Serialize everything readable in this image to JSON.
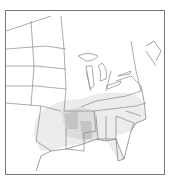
{
  "map": {
    "type": "species-range-map",
    "region": "Eastern United States",
    "colors": {
      "background": "#ffffff",
      "border": "#777777",
      "state_lines": "#888888",
      "range_light": "#e6e6e6",
      "range_medium": "#d2d2d2",
      "range_dark": "#bdbdbd"
    },
    "range_description": "Shaded range covering the southeastern US: Gulf Coast states, Tennessee, Kentucky, Carolinas, Georgia, Florida, with darker core over Arkansas and Mississippi and lighter fringe extending into eastern Texas and Oklahoma"
  }
}
